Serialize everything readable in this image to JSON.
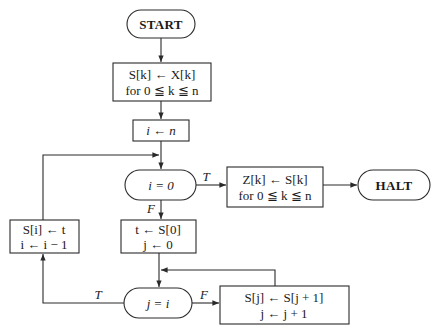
{
  "flowchart": {
    "start": {
      "label": "START"
    },
    "init_copy": {
      "line1": "S[k] ← X[k]",
      "line2": "for 0 ≦ k ≦ n"
    },
    "init_i": {
      "label": "i ← n"
    },
    "test_i": {
      "label": "i = 0"
    },
    "output_copy": {
      "line1": "Z[k] ← S[k]",
      "line2": "for 0 ≦ k ≦ n"
    },
    "halt": {
      "label": "HALT"
    },
    "init_t_j": {
      "line1": "t ← S[0]",
      "line2": "j ← 0"
    },
    "test_j": {
      "label": "j = i"
    },
    "shift": {
      "line1": "S[j] ← S[j + 1]",
      "line2": "j ← j + 1"
    },
    "store_dec": {
      "line1": "S[i] ← t",
      "line2": "i ← i − 1"
    },
    "edge_labels": {
      "test_i_true": "T",
      "test_i_false": "F",
      "test_j_true": "T",
      "test_j_false": "F"
    }
  }
}
